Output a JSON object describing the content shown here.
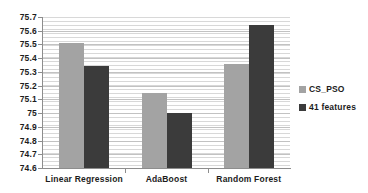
{
  "chart_data": {
    "type": "bar",
    "title": "",
    "subtitle": "",
    "xlabel": "",
    "ylabel": "",
    "ylim": [
      74.6,
      75.7
    ],
    "ytick_step": 0.1,
    "ytick_labels": [
      "75.7",
      "75.6",
      "75.5",
      "75.4",
      "75.3",
      "75.2",
      "75.1",
      "75",
      "74.9",
      "74.8",
      "74.7",
      "74.6"
    ],
    "ytick_values": [
      75.7,
      75.6,
      75.5,
      75.4,
      75.3,
      75.2,
      75.1,
      75.0,
      74.9,
      74.8,
      74.7,
      74.6
    ],
    "grid": "horizontal-minor",
    "legend_position": "right",
    "categories": [
      "Linear Regression",
      "AdaBoost",
      "Random Forest"
    ],
    "series": [
      {
        "name": "CS_PSO",
        "color": "#a3a3a3",
        "values": [
          75.51,
          75.145,
          75.36
        ]
      },
      {
        "name": "41 features",
        "color": "#3b3b3b",
        "values": [
          75.34,
          75.0,
          75.64
        ]
      }
    ]
  },
  "colors": {
    "series_cs_pso": "#a3a3a3",
    "series_41_features": "#3b3b3b",
    "gridline": "#d8d8d8",
    "axis": "#8d8d8d",
    "text": "#1c1c1c",
    "background": "#ffffff"
  }
}
